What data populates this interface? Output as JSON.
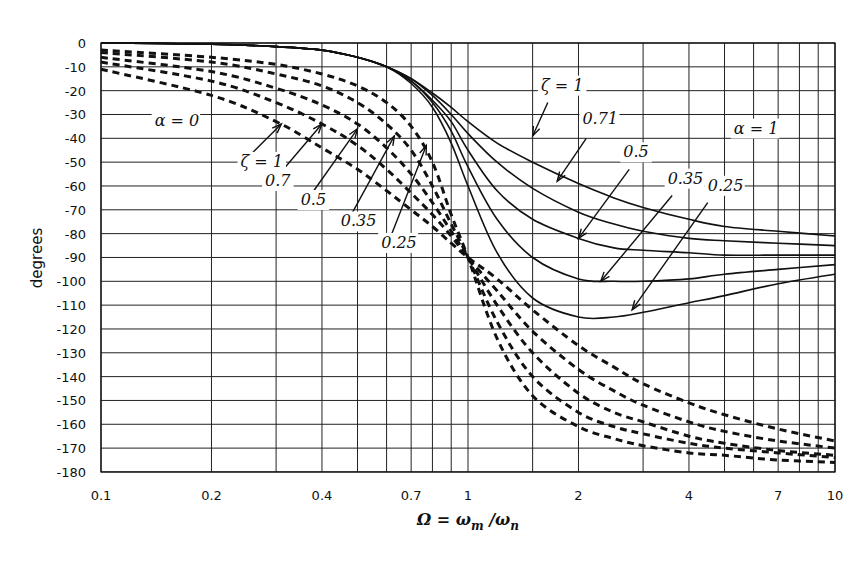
{
  "chart_data": {
    "type": "line",
    "title": "",
    "xlabel": "Ω = ωm/ωn",
    "ylabel": "degrees",
    "xscale": "log",
    "xlim": [
      0.1,
      10
    ],
    "ylim": [
      -180,
      0
    ],
    "grid": true,
    "x_tick_labels": [
      {
        "value": 0.1,
        "label": "0.1"
      },
      {
        "value": 0.2,
        "label": "0.2"
      },
      {
        "value": 0.4,
        "label": "0.4"
      },
      {
        "value": 0.7,
        "label": "0.7"
      },
      {
        "value": 1,
        "label": "1"
      },
      {
        "value": 2,
        "label": "2"
      },
      {
        "value": 4,
        "label": "4"
      },
      {
        "value": 7,
        "label": "7"
      },
      {
        "value": 10,
        "label": "10"
      }
    ],
    "x_gridlines": [
      0.1,
      0.2,
      0.3,
      0.4,
      0.5,
      0.6,
      0.7,
      0.8,
      0.9,
      1,
      1.5,
      2,
      3,
      4,
      5,
      6,
      7,
      8,
      9,
      10
    ],
    "y_ticks": [
      0,
      -10,
      -20,
      -30,
      -40,
      -50,
      -60,
      -70,
      -80,
      -90,
      -100,
      -110,
      -120,
      -130,
      -140,
      -150,
      -160,
      -170,
      -180
    ],
    "x": [
      0.1,
      0.2,
      0.3,
      0.4,
      0.5,
      0.6,
      0.7,
      0.8,
      0.9,
      1,
      1.2,
      1.5,
      2,
      2.5,
      3,
      4,
      5,
      7,
      10
    ],
    "series": [
      {
        "name": "α=1, ζ=1",
        "style": "solid",
        "values": [
          0,
          -0.5,
          -1.5,
          -3,
          -6,
          -10,
          -15,
          -21,
          -27,
          -33,
          -42,
          -50,
          -59,
          -65,
          -69,
          -74,
          -77,
          -79,
          -81
        ]
      },
      {
        "name": "α=1, ζ=0.71",
        "style": "solid",
        "values": [
          0,
          -0.5,
          -1.5,
          -3,
          -6,
          -10,
          -15,
          -22,
          -30,
          -38,
          -50,
          -61,
          -71,
          -76,
          -79,
          -82,
          -83,
          -84,
          -85
        ]
      },
      {
        "name": "α=1, ζ=0.5",
        "style": "solid",
        "values": [
          0,
          -0.5,
          -1.5,
          -3,
          -6,
          -10,
          -16,
          -24,
          -33,
          -45,
          -62,
          -74,
          -82,
          -86,
          -87,
          -88,
          -89,
          -89,
          -89
        ]
      },
      {
        "name": "α=1, ζ=0.35",
        "style": "solid",
        "values": [
          0,
          -0.5,
          -1.5,
          -3,
          -6,
          -10,
          -16,
          -25,
          -37,
          -52,
          -74,
          -90,
          -99,
          -100,
          -100,
          -99,
          -97,
          -95,
          -93
        ]
      },
      {
        "name": "α=1, ζ=0.25",
        "style": "solid",
        "values": [
          0,
          -0.5,
          -1.5,
          -3,
          -6,
          -10,
          -17,
          -27,
          -42,
          -60,
          -88,
          -107,
          -115,
          -115,
          -113,
          -109,
          -106,
          -101,
          -97
        ]
      },
      {
        "name": "α=0, ζ=1",
        "style": "dashed",
        "values": [
          -11,
          -22,
          -33,
          -44,
          -53,
          -62,
          -70,
          -77,
          -84,
          -90,
          -99,
          -112,
          -127,
          -136,
          -143,
          -151,
          -156,
          -162,
          -167
        ]
      },
      {
        "name": "α=0, ζ=0.7",
        "style": "dashed",
        "values": [
          -8,
          -16,
          -25,
          -34,
          -43,
          -53,
          -63,
          -72,
          -81,
          -90,
          -104,
          -121,
          -137,
          -146,
          -152,
          -159,
          -163,
          -167,
          -170
        ]
      },
      {
        "name": "α=0, ζ=0.5",
        "style": "dashed",
        "values": [
          -6,
          -12,
          -19,
          -26,
          -34,
          -44,
          -55,
          -67,
          -79,
          -90,
          -110,
          -130,
          -147,
          -155,
          -159,
          -165,
          -168,
          -171,
          -173
        ]
      },
      {
        "name": "α=0, ζ=0.35",
        "style": "dashed",
        "values": [
          -4,
          -8,
          -13,
          -18,
          -25,
          -34,
          -45,
          -60,
          -76,
          -90,
          -117,
          -140,
          -155,
          -161,
          -164,
          -168,
          -170,
          -172,
          -174
        ]
      },
      {
        "name": "α=0, ζ=0.25",
        "style": "dashed",
        "values": [
          -3,
          -6,
          -9,
          -13,
          -18,
          -25,
          -35,
          -50,
          -72,
          -90,
          -124,
          -148,
          -161,
          -166,
          -169,
          -172,
          -173,
          -175,
          -176
        ]
      }
    ],
    "annotations": [
      {
        "text": "α = 0",
        "x": 0.14,
        "y": -35
      },
      {
        "text": "α = 1",
        "x": 5.3,
        "y": -38
      },
      {
        "text": "ζ = 1",
        "x": 0.24,
        "y": -52
      },
      {
        "text": "0.7",
        "x": 0.28,
        "y": -60
      },
      {
        "text": "0.5",
        "x": 0.35,
        "y": -68
      },
      {
        "text": "0.35",
        "x": 0.45,
        "y": -77
      },
      {
        "text": "0.25",
        "x": 0.58,
        "y": -86
      },
      {
        "text": "ζ = 1",
        "x": 1.58,
        "y": -20
      },
      {
        "text": "0.71",
        "x": 2.05,
        "y": -34
      },
      {
        "text": "0.5",
        "x": 2.65,
        "y": -48
      },
      {
        "text": "0.35",
        "x": 3.5,
        "y": -59
      },
      {
        "text": "0.25",
        "x": 4.5,
        "y": -62
      }
    ]
  },
  "axes": {
    "ylabel": "degrees",
    "xlabel_main": "Ω = ω",
    "xlabel_sub_m": "m",
    "xlabel_slash": " /ω",
    "xlabel_sub_n": "n"
  }
}
